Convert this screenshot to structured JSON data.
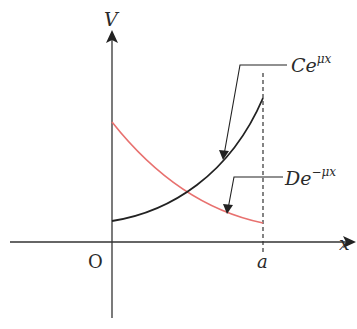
{
  "axes": {
    "y_label": "V",
    "x_label": "x",
    "origin_label": "O",
    "x_marker_label": "a"
  },
  "curves": [
    {
      "name": "Ce^{μx}",
      "base": "Ce",
      "exponent": "μx",
      "color": "#222222",
      "trend": "increasing"
    },
    {
      "name": "De^{-μx}",
      "base": "De",
      "exponent": "−μx",
      "color": "#e8716f",
      "trend": "decreasing"
    }
  ],
  "colors": {
    "axis": "#333333",
    "growth_curve": "#222222",
    "decay_curve": "#e8716f",
    "dashed_marker": "#333333"
  }
}
